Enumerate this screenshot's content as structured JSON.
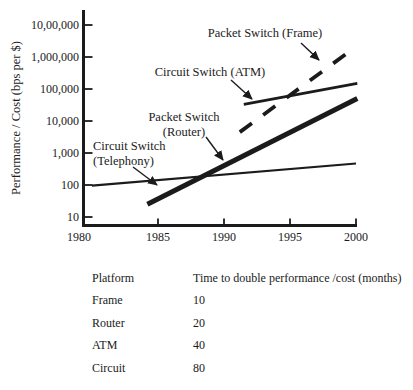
{
  "figure": {
    "background": "#ffffff",
    "ink_color": "#1b1b1b"
  },
  "chart_data": {
    "type": "line",
    "title": "",
    "xlabel": "",
    "ylabel": "Performance / Cost (bps per $)",
    "grid": false,
    "legend": "none (labels annotated with arrows on plot)",
    "x_axis": {
      "min": 1980,
      "max": 2000,
      "ticks": [
        {
          "year": 1980,
          "label": "1980",
          "tick": false,
          "dx": -13
        },
        {
          "year": 1985,
          "label": "1985",
          "tick": true,
          "dx": 0
        },
        {
          "year": 1990,
          "label": "1990",
          "tick": true,
          "dx": 0
        },
        {
          "year": 1995,
          "label": "1995",
          "tick": true,
          "dx": 0
        },
        {
          "year": 2000,
          "label": "2000",
          "tick": true,
          "dx": 0
        }
      ]
    },
    "y_axis": {
      "scale": "log",
      "min": 10,
      "max": 10000000,
      "ticks": [
        {
          "value": 10000000,
          "label": "10,00,000"
        },
        {
          "value": 1000000,
          "label": "1,000,000"
        },
        {
          "value": 100000,
          "label": "100,000"
        },
        {
          "value": 10000,
          "label": "10,000"
        },
        {
          "value": 1000,
          "label": "1,000"
        },
        {
          "value": 100,
          "label": "100"
        },
        {
          "value": 10,
          "label": "10"
        }
      ]
    },
    "pixel_map": {
      "x0": 92,
      "px_per_year": 13.2,
      "y_at_10": 217,
      "px_per_decade": 32
    },
    "series": [
      {
        "id": "telephony",
        "name": "Circuit Switch (Telephony)",
        "style": "solid",
        "stroke_px": 2.2,
        "points": [
          [
            1980,
            95
          ],
          [
            2000,
            470
          ]
        ]
      },
      {
        "id": "router",
        "name": "Packet Switch (Router)",
        "style": "solid",
        "stroke_px": 5,
        "points": [
          [
            1984.2,
            25
          ],
          [
            2000.1,
            50000
          ]
        ]
      },
      {
        "id": "atm",
        "name": "Circuit Switch (ATM)",
        "style": "solid",
        "stroke_px": 2.6,
        "points": [
          [
            1991.5,
            33000
          ],
          [
            2000.1,
            150000
          ]
        ]
      },
      {
        "id": "frame",
        "name": "Packet Switch (Frame)",
        "style": "dashed",
        "dash": "15 14",
        "stroke_px": 3.8,
        "points": [
          [
            1991.2,
            4500
          ],
          [
            1999.3,
            1300000
          ]
        ]
      }
    ],
    "annotations": [
      {
        "id": "frame-annotation",
        "lines": [
          "Packet Switch (Frame)"
        ],
        "align": "middle",
        "text_x": 265,
        "text_y": 37,
        "arrow": [
          301,
          43,
          319,
          60
        ]
      },
      {
        "id": "atm-annotation",
        "lines": [
          "Circuit Switch (ATM)"
        ],
        "align": "middle",
        "text_x": 210,
        "text_y": 76,
        "arrow": [
          231,
          80,
          252,
          99
        ]
      },
      {
        "id": "router-annotation",
        "lines": [
          "Packet Switch",
          "(Router)"
        ],
        "align": "middle",
        "text_x": 184,
        "text_y": 121,
        "arrow": [
          206,
          137,
          223,
          160
        ]
      },
      {
        "id": "telephony-annotation",
        "lines": [
          "Circuit Switch",
          "(Telephony)"
        ],
        "align": "start",
        "text_x": 93,
        "text_y": 150,
        "arrow": [
          133,
          167,
          157,
          185
        ]
      }
    ]
  },
  "table": {
    "headers": [
      "Platform",
      "Time to double performance /cost (months)"
    ],
    "rows": [
      {
        "platform": "Frame",
        "months": "10"
      },
      {
        "platform": "Router",
        "months": "20"
      },
      {
        "platform": "ATM",
        "months": "40"
      },
      {
        "platform": "Circuit",
        "months": "80"
      }
    ]
  }
}
